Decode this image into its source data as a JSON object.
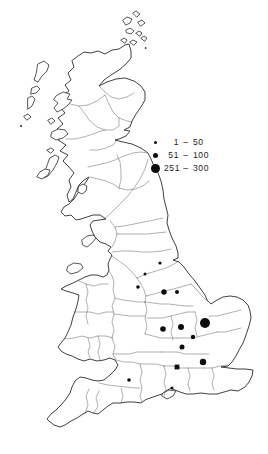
{
  "figure": {
    "region": "Great Britain",
    "background_color": "#ffffff",
    "coast_color": "#2b2b2b",
    "boundary_color": "#4f4f4f",
    "symbol_color": "#0d0d0d"
  },
  "legend": {
    "separator": "–",
    "items": [
      {
        "label": "1 – 50",
        "range_low": "1",
        "range_high": "50",
        "dot_diameter": 3
      },
      {
        "label": "51 – 100",
        "range_low": "51",
        "range_high": "100",
        "dot_diameter": 5
      },
      {
        "label": "251 – 300",
        "range_low": "251",
        "range_high": "300",
        "dot_diameter": 9
      }
    ]
  },
  "chart_data": {
    "type": "proportional-symbol-map",
    "region": "Great Britain county outline map",
    "size_classes": [
      "1-50",
      "51-100",
      "251-300"
    ],
    "points": [
      {
        "x": 160,
        "y": 263,
        "r": 1.6,
        "shape": "circle",
        "size_class": "1-50"
      },
      {
        "x": 145,
        "y": 274,
        "r": 1.5,
        "shape": "circle",
        "size_class": "1-50"
      },
      {
        "x": 138,
        "y": 287,
        "r": 1.8,
        "shape": "circle",
        "size_class": "1-50"
      },
      {
        "x": 164,
        "y": 292,
        "r": 2.7,
        "shape": "circle",
        "size_class": "51-100"
      },
      {
        "x": 177,
        "y": 292,
        "r": 2.0,
        "shape": "circle",
        "size_class": "1-50"
      },
      {
        "x": 163,
        "y": 329,
        "r": 2.8,
        "shape": "circle",
        "size_class": "51-100"
      },
      {
        "x": 181,
        "y": 327,
        "r": 3.0,
        "shape": "circle",
        "size_class": "51-100"
      },
      {
        "x": 205,
        "y": 323,
        "r": 5.0,
        "shape": "circle",
        "size_class": "251-300"
      },
      {
        "x": 193,
        "y": 337,
        "r": 2.2,
        "shape": "circle",
        "size_class": "51-100"
      },
      {
        "x": 182,
        "y": 347,
        "r": 2.5,
        "shape": "circle",
        "size_class": "51-100"
      },
      {
        "x": 177,
        "y": 367,
        "r": 2.4,
        "shape": "square",
        "size_class": "51-100"
      },
      {
        "x": 203,
        "y": 362,
        "r": 3.2,
        "shape": "circle",
        "size_class": "51-100"
      },
      {
        "x": 129,
        "y": 380,
        "r": 1.8,
        "shape": "circle",
        "size_class": "1-50"
      },
      {
        "x": 172,
        "y": 388,
        "r": 1.5,
        "shape": "circle",
        "size_class": "1-50"
      }
    ]
  }
}
